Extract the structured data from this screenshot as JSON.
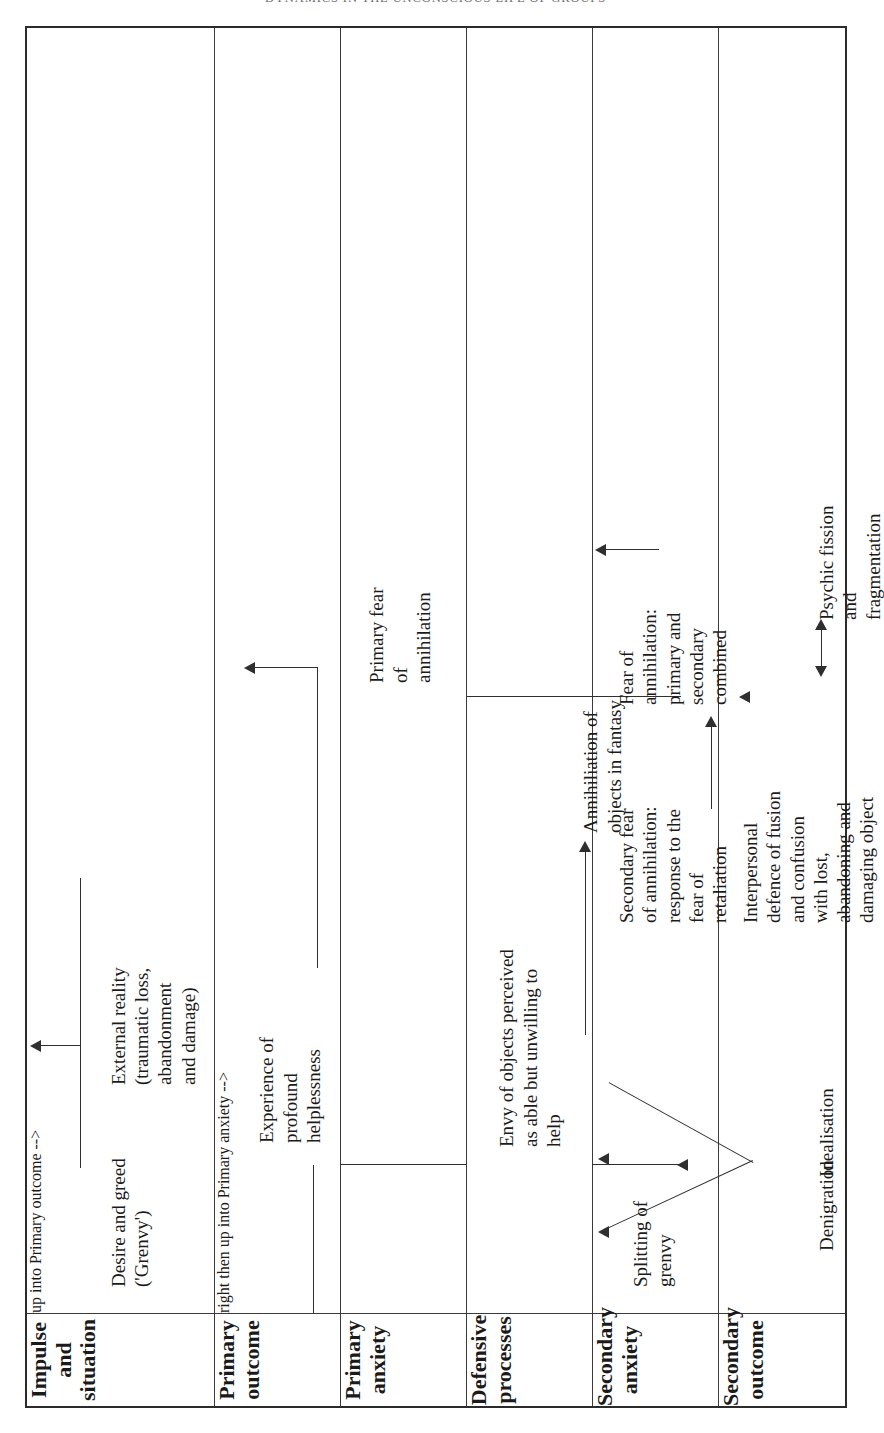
{
  "running_head": "DYNAMICS IN THE UNCONSCIOUS LIFE OF GROUPS",
  "table": {
    "orientation": "rotated-90-ccw",
    "row_headers": [
      "Impulse and\nsituation",
      "Primary\noutcome",
      "Primary\nanxiety",
      "Defensive processes",
      "Secondary\nanxiety",
      "Secondary\noutcome"
    ],
    "rows": [
      {
        "header": "Impulse and\nsituation",
        "cells": [
          "Desire and greed\n('Grenvy')",
          "External reality\n(traumatic loss,\nabandonment\nand damage)"
        ]
      },
      {
        "header": "Primary\noutcome",
        "cells": [
          "Experience of\nprofound\nhelplessness"
        ]
      },
      {
        "header": "Primary\nanxiety",
        "cells": [
          "Primary fear\nof\nannihilation"
        ]
      },
      {
        "header": "Defensive processes",
        "cells": [
          "Splitting of\ngrenvy",
          "Envy of objects perceived\nas able but unwilling to\nhelp",
          "Annihiliation of\nobjects in fantasy"
        ]
      },
      {
        "header": "Secondary\nanxiety",
        "cells": [
          "Secondary fear\nof annihilation:\nresponse to the\nfear of\nretaliation",
          "Fear of\nannihilation:\nprimary and\nsecondary\ncombined"
        ]
      },
      {
        "header": "Secondary\noutcome",
        "cells": [
          "Denigration",
          "Idealisation",
          "Interpersonal\ndefence of fusion\nand confusion\nwith lost,\nabandoning and\ndamaging object",
          "Psychic fission\nand\nfragmentation"
        ]
      }
    ],
    "connectors": [
      {
        "name": "grenvy-to-helplessness",
        "kind": "elbow-up-arrow"
      },
      {
        "name": "external-reality-to-helplessness",
        "kind": "elbow-up-arrow"
      },
      {
        "name": "helplessness-to-primary-fear",
        "kind": "elbow-up-arrow"
      },
      {
        "name": "primary-fear-to-splitting",
        "kind": "long-up-arrow"
      },
      {
        "name": "splitting-to-envy",
        "kind": "up-arrow"
      },
      {
        "name": "envy-to-annihilation-of-objects",
        "kind": "right-arrow"
      },
      {
        "name": "annihilation-of-objects-to-secondary-fear",
        "kind": "long-up-arrow"
      },
      {
        "name": "secondary-fear-to-fear-of-annihilation",
        "kind": "right-arrow"
      },
      {
        "name": "splitting-v-to-denigration-and-idealisation",
        "kind": "v-split-two-arrows"
      },
      {
        "name": "fear-of-annihilation-to-psychic-fission",
        "kind": "up-arrow"
      },
      {
        "name": "fusion-fission-double-arrow",
        "kind": "double-headed-arrow"
      }
    ]
  },
  "colors": {
    "ink": "#1b1b1b",
    "rule": "#3a3a3a",
    "outer_rule": "#2b2b2b",
    "running_head": "#6e6e72",
    "page": "#ffffff"
  }
}
